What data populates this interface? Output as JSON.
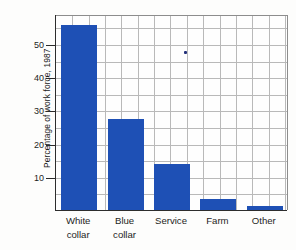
{
  "chart_data": {
    "type": "bar",
    "title": "",
    "subtitle": "",
    "xlabel": "",
    "ylabel": "Percentage of work force, 1987",
    "categories": [
      "White collar",
      "Blue collar",
      "Service",
      "Farm",
      "Other"
    ],
    "category_lines": [
      [
        "White",
        "collar"
      ],
      [
        "Blue",
        "collar"
      ],
      [
        "Service"
      ],
      [
        "Farm"
      ],
      [
        "Other"
      ]
    ],
    "values": [
      55.7,
      27.4,
      13.8,
      3.3,
      1.2
    ],
    "ylim": [
      0,
      59
    ],
    "yticks": [
      10,
      20,
      30,
      40,
      50
    ],
    "ytick_labels": [
      "10",
      "20",
      "30",
      "40",
      "50"
    ],
    "grid": true,
    "grid_color": "#b9b9b9",
    "legend": "none",
    "bar_color": "#1e50b5",
    "axis_color": "#2d2d2d",
    "background": "#fdfdfc",
    "artifact_speck": {
      "name": "stray-ink-speck",
      "color": "#23307a",
      "x_pct": 55.2,
      "y_pct": 18.4
    }
  }
}
